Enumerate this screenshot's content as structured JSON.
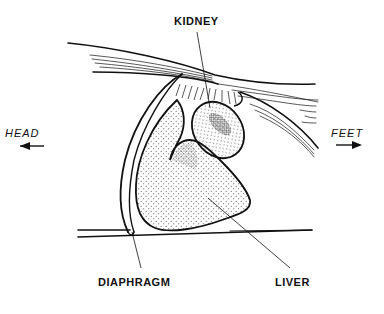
{
  "diagram": {
    "labels": {
      "kidney": "KIDNEY",
      "diaphragm": "DIAPHRAGM",
      "liver": "LIVER"
    },
    "directions": {
      "head": "HEAD",
      "feet": "FEET"
    },
    "direction_icons": {
      "head": "arrow-left-icon",
      "feet": "arrow-right-icon"
    },
    "colors": {
      "ink": "#111111",
      "background": "#ffffff",
      "stipple": "#333333"
    }
  }
}
